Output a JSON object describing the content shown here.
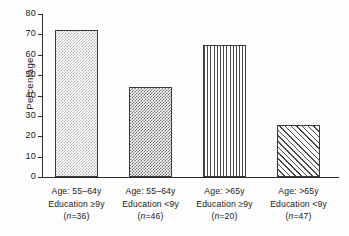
{
  "chart_data": {
    "type": "bar",
    "title": "",
    "xlabel": "",
    "ylabel": "Percentage",
    "ylim": [
      0,
      80
    ],
    "yticks": [
      0,
      10,
      20,
      30,
      40,
      50,
      60,
      70,
      80
    ],
    "grid": false,
    "legend": "none",
    "categories": [
      "Age: 55–64y Education ≥9y (n=36)",
      "Age: 55–64y Education <9y (n=46)",
      "Age: >65y Education ≥9y (n=20)",
      "Age: >65y Education <9y (n=47)"
    ],
    "values": [
      72,
      44,
      65,
      25.5
    ],
    "bars": [
      {
        "line1": "Age: 55–64y",
        "line2": "Education ≥9y",
        "n_open": "(",
        "n_italic": "n",
        "n_rest": "=36)",
        "value": 72,
        "pattern": "dots-light"
      },
      {
        "line1": "Age: 55–64y",
        "line2": "Education <9y",
        "n_open": "(",
        "n_italic": "n",
        "n_rest": "=46)",
        "value": 44,
        "pattern": "dots-dark"
      },
      {
        "line1": "Age: >65y",
        "line2": "Education ≥9y",
        "n_open": "(",
        "n_italic": "n",
        "n_rest": "=20)",
        "value": 65,
        "pattern": "vertical-lines"
      },
      {
        "line1": "Age: >65y",
        "line2": "Education <9y",
        "n_open": "(",
        "n_italic": "n",
        "n_rest": "=47)",
        "value": 25.5,
        "pattern": "diagonal-hatch"
      }
    ]
  },
  "axis": {
    "y_title": "Percentage",
    "y_tick_labels": [
      "80",
      "70",
      "60",
      "50",
      "40",
      "30",
      "20",
      "10",
      "0"
    ]
  },
  "colors": {
    "axis": "#2b2b2b",
    "text": "#1a1a1a",
    "background": "#fdfdfd",
    "pattern_light": "#b9b9b9",
    "pattern_dark": "#6d6d6d",
    "pattern_line": "#4a4a4a"
  }
}
